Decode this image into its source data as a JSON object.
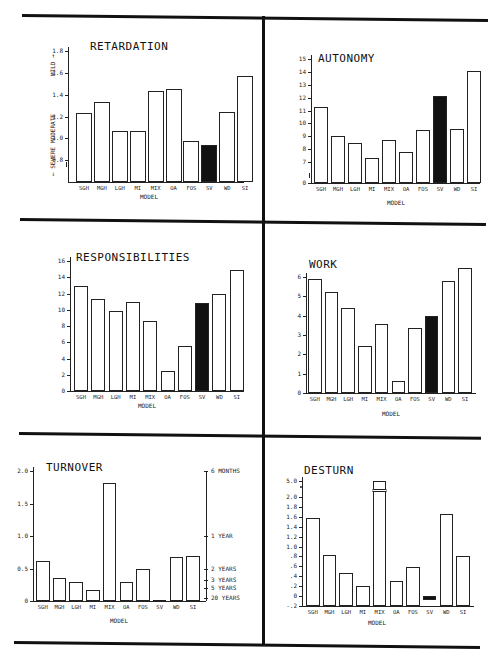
{
  "chart_data": [
    {
      "type": "bar",
      "title": "RETARDATION",
      "xlabel": "MODEL",
      "ylabel": "← SEVERE   MODERATE   MILD →",
      "ylabel_parts": [
        "← SEVERE",
        "MODERATE",
        "MILD →"
      ],
      "categories": [
        "SGH",
        "MGH",
        "LGH",
        "MI",
        "MIX",
        "OA",
        "FOS",
        "SV",
        "WD",
        "SI"
      ],
      "values": [
        1.23,
        1.33,
        1.07,
        1.07,
        1.43,
        1.45,
        0.98,
        0.94,
        1.24,
        1.57
      ],
      "highlight": "SV",
      "yticks": [
        "0.8",
        "1.0",
        "1.2",
        "1.4",
        "1.6",
        "1.8"
      ],
      "ylim": [
        0.6,
        1.8
      ],
      "axis_break": true
    },
    {
      "type": "bar",
      "title": "AUTONOMY",
      "xlabel": "MODEL",
      "ylabel": "",
      "categories": [
        "SGH",
        "MGH",
        "LGH",
        "MI",
        "MIX",
        "OA",
        "FOS",
        "SV",
        "WD",
        "SI"
      ],
      "values": [
        11.3,
        9.0,
        8.5,
        7.3,
        8.7,
        7.8,
        9.5,
        12.1,
        9.6,
        14.1
      ],
      "highlight": "SV",
      "yticks": [
        "0",
        "7",
        "8",
        "9",
        "10",
        "11",
        "12",
        "13",
        "14",
        "15"
      ],
      "ylim": [
        0,
        15
      ],
      "axis_break": true
    },
    {
      "type": "bar",
      "title": "RESPONSIBILITIES",
      "xlabel": "MODEL",
      "ylabel": "",
      "categories": [
        "SGH",
        "MGH",
        "LGH",
        "MI",
        "MIX",
        "OA",
        "FOS",
        "SV",
        "WD",
        "SI"
      ],
      "values": [
        12.9,
        11.3,
        9.9,
        10.9,
        8.6,
        2.5,
        5.5,
        10.8,
        12.0,
        14.9
      ],
      "highlight": "SV",
      "yticks": [
        "0",
        "2",
        "4",
        "6",
        "8",
        "10",
        "12",
        "14",
        "16"
      ],
      "ylim": [
        0,
        16
      ]
    },
    {
      "type": "bar",
      "title": "WORK",
      "xlabel": "MODEL",
      "ylabel": "",
      "categories": [
        "SGH",
        "MGH",
        "LGH",
        "MI",
        "MIX",
        "OA",
        "FOS",
        "SV",
        "WD",
        "SI"
      ],
      "values": [
        5.9,
        5.2,
        4.4,
        2.45,
        3.55,
        0.6,
        3.35,
        4.0,
        5.8,
        6.45
      ],
      "highlight": "SV",
      "yticks": [
        "0",
        "1",
        "2",
        "3",
        "4",
        "5",
        "6"
      ],
      "ylim": [
        0,
        6.5
      ]
    },
    {
      "type": "bar",
      "title": "TURNOVER",
      "xlabel": "MODEL",
      "ylabel": "",
      "categories": [
        "SGH",
        "MGH",
        "LGH",
        "MI",
        "MIX",
        "OA",
        "FOS",
        "SV",
        "WD",
        "SI"
      ],
      "values": [
        0.62,
        0.36,
        0.29,
        0.17,
        1.82,
        0.3,
        0.49,
        0.02,
        0.68,
        0.7
      ],
      "highlight": "SV",
      "yticks": [
        "0",
        "0.5",
        "1.0",
        "1.5",
        "2.0"
      ],
      "ylim": [
        0,
        2.0
      ],
      "right_axis_labels": [
        {
          "label": "6 MONTHS",
          "value": 2.0
        },
        {
          "label": "1 YEAR",
          "value": 1.0
        },
        {
          "label": "2 YEARS",
          "value": 0.5
        },
        {
          "label": "3 YEARS",
          "value": 0.33
        },
        {
          "label": "5 YEARS",
          "value": 0.2
        },
        {
          "label": "20 YEARS",
          "value": 0.05
        }
      ]
    },
    {
      "type": "bar",
      "title": "DESTURN",
      "xlabel": "MODEL",
      "ylabel": "",
      "categories": [
        "SGH",
        "MGH",
        "LGH",
        "MI",
        "MIX",
        "OA",
        "FOS",
        "SV",
        "WD",
        "SI"
      ],
      "values": [
        1.58,
        0.82,
        0.47,
        0.21,
        5.0,
        0.31,
        0.59,
        -0.08,
        1.66,
        0.8
      ],
      "highlight": "SV",
      "yticks": [
        "-.2",
        "0",
        ".2",
        ".4",
        ".6",
        ".8",
        "1.0",
        "1.2",
        "1.4",
        "1.6",
        "1.8",
        "2.0",
        "5.0"
      ],
      "ylim": [
        -0.2,
        5.0
      ],
      "axis_break": true,
      "broken_bar": "MIX"
    }
  ]
}
